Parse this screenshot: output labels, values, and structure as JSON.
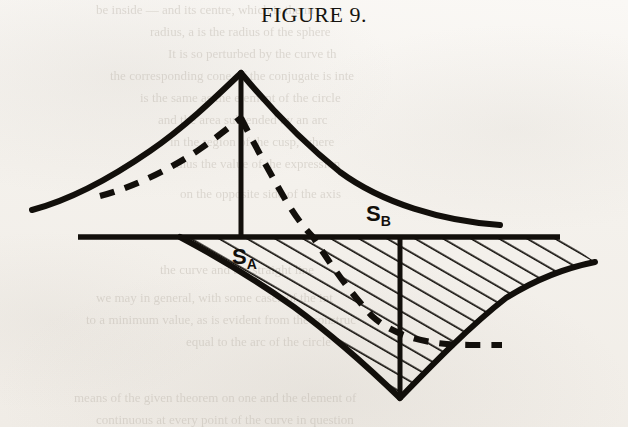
{
  "figure": {
    "title": "FIGURE 9.",
    "ink_color": "#120f0b",
    "paper_color": "#f4f1ec",
    "labels": {
      "s_a": {
        "base": "S",
        "subscript": "A",
        "x": 232,
        "y": 246
      },
      "s_b": {
        "base": "S",
        "subscript": "B",
        "x": 366,
        "y": 203
      }
    }
  },
  "bleed_through": [
    {
      "text": "be inside — and its centre, which is the m",
      "x": 96,
      "y": 2,
      "size": 13
    },
    {
      "text": "radius, a is the radius of the sphere",
      "x": 150,
      "y": 24,
      "size": 13
    },
    {
      "text": "It is so perturbed by the curve th",
      "x": 168,
      "y": 46,
      "size": 13
    },
    {
      "text": "the corresponding cone. If the conjugate is inte",
      "x": 110,
      "y": 68,
      "size": 13
    },
    {
      "text": "is the same as the element of the circle",
      "x": 140,
      "y": 90,
      "size": 13
    },
    {
      "text": "and the area subtended by an arc",
      "x": 158,
      "y": 112,
      "size": 13
    },
    {
      "text": "in the region of the cusp, where",
      "x": 170,
      "y": 134,
      "size": 13
    },
    {
      "text": "thus the value of the expression",
      "x": 176,
      "y": 156,
      "size": 13
    },
    {
      "text": "on the opposite side of the axis",
      "x": 180,
      "y": 186,
      "size": 13
    },
    {
      "text": "the curve and the straight line",
      "x": 160,
      "y": 262,
      "size": 13
    },
    {
      "text": "we may in general, with some cases of the int",
      "x": 96,
      "y": 290,
      "size": 13
    },
    {
      "text": "to a minimum value, as is evident from the construc",
      "x": 86,
      "y": 312,
      "size": 13
    },
    {
      "text": "equal to the arc of the circle",
      "x": 186,
      "y": 334,
      "size": 13
    },
    {
      "text": "means of the given theorem on one and the element of",
      "x": 74,
      "y": 390,
      "size": 13
    },
    {
      "text": "continuous at every point of the curve in question",
      "x": 96,
      "y": 412,
      "size": 13
    }
  ],
  "chart_data": {
    "type": "line",
    "title": "FIGURE 9.",
    "xlabel": "",
    "ylabel": "",
    "grid": false,
    "legend": null,
    "axis_line": {
      "y": 237,
      "x_start": 78,
      "x_end": 560
    },
    "apex": {
      "x": 241,
      "y": 73
    },
    "lower_cusp": {
      "x": 400,
      "y": 398
    },
    "vertical_line": {
      "x": 241,
      "y_top": 73,
      "y_bottom": 237
    },
    "vertical_line_lower": {
      "x": 400,
      "y_top": 237,
      "y_bottom": 398
    },
    "series": [
      {
        "name": "upper-solid-curve-left",
        "style": "solid",
        "points": [
          [
            32,
            210
          ],
          [
            60,
            198
          ],
          [
            95,
            184
          ],
          [
            130,
            164
          ],
          [
            165,
            139
          ],
          [
            200,
            110
          ],
          [
            224,
            88
          ],
          [
            241,
            73
          ]
        ]
      },
      {
        "name": "upper-solid-curve-right",
        "style": "solid",
        "points": [
          [
            241,
            73
          ],
          [
            262,
            96
          ],
          [
            290,
            126
          ],
          [
            322,
            157
          ],
          [
            360,
            183
          ],
          [
            405,
            203
          ],
          [
            455,
            217
          ],
          [
            500,
            225
          ]
        ]
      },
      {
        "name": "inner-dashed-curve-left",
        "style": "dashed",
        "points": [
          [
            100,
            196
          ],
          [
            130,
            187
          ],
          [
            162,
            174
          ],
          [
            192,
            157
          ],
          [
            216,
            138
          ],
          [
            232,
            125
          ],
          [
            241,
            118
          ]
        ]
      },
      {
        "name": "inner-dashed-curve-right",
        "style": "dashed",
        "points": [
          [
            241,
            118
          ],
          [
            252,
            139
          ],
          [
            266,
            165
          ],
          [
            283,
            195
          ],
          [
            300,
            221
          ],
          [
            313,
            237
          ],
          [
            330,
            262
          ],
          [
            352,
            294
          ],
          [
            380,
            325
          ],
          [
            420,
            340
          ],
          [
            460,
            344
          ],
          [
            500,
            345
          ]
        ]
      },
      {
        "name": "lower-boundary-left",
        "style": "solid",
        "points": [
          [
            180,
            237
          ],
          [
            215,
            255
          ],
          [
            252,
            277
          ],
          [
            292,
            305
          ],
          [
            330,
            337
          ],
          [
            366,
            368
          ],
          [
            400,
            398
          ]
        ]
      },
      {
        "name": "lower-boundary-right",
        "style": "solid",
        "points": [
          [
            400,
            398
          ],
          [
            436,
            362
          ],
          [
            470,
            325
          ],
          [
            505,
            297
          ],
          [
            540,
            277
          ],
          [
            570,
            267
          ],
          [
            595,
            262
          ]
        ]
      }
    ],
    "hatching": {
      "angle_deg": 60,
      "spacing_px": 14,
      "region": "between axis line and the two lower boundary curves"
    },
    "annotations": [
      {
        "text": "S_A",
        "x": 245,
        "y": 258,
        "note": "inside hatched region, left of centre"
      },
      {
        "text": "S_B",
        "x": 380,
        "y": 215,
        "note": "above the axis, right of centre"
      }
    ]
  }
}
